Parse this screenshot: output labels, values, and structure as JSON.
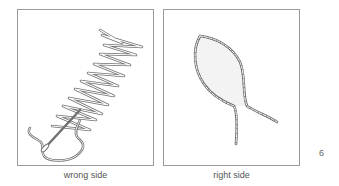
{
  "figure": {
    "panels": [
      {
        "caption": "wrong side",
        "illustration": "herringbone-stitch-back-with-needle"
      },
      {
        "caption": "right side",
        "illustration": "stem-stitch-leaf-outline"
      }
    ],
    "page_number": "6"
  },
  "colors": {
    "frame": "#9a9a9a",
    "thread": "#6e6e6e",
    "caption_text": "#555555"
  }
}
